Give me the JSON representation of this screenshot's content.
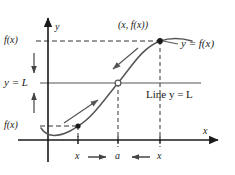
{
  "figure": {
    "type": "calculus-limit-diagram",
    "background_color": "#ffffff",
    "ink_color": "#1a1a1a",
    "curve_color": "#555555",
    "axes": {
      "y_axis_label": "y",
      "x_axis_label": "x",
      "origin_x": 48,
      "origin_y": 140
    },
    "labels": {
      "upper_value": "f(x)",
      "limit_value": "y = L",
      "lower_value": "f(x)",
      "point_label": "(x, f(x))",
      "curve_label": "y = f(x)",
      "line_label": "Line y = L",
      "axis_left_x": "x",
      "axis_center_a": "a",
      "axis_right_x": "x",
      "arrow_right": "⟶",
      "arrow_left": "⟵"
    },
    "guides": {
      "upper_dashed_y": 41,
      "limit_line_y": 83,
      "lower_dashed_y": 126,
      "left_x_vline": 78,
      "a_vline": 118,
      "right_x_vline": 160
    },
    "markers": [
      {
        "name": "lower-left-point",
        "style": "filled",
        "x": 78,
        "y": 126
      },
      {
        "name": "limit-point",
        "style": "hollow",
        "x": 118,
        "y": 83
      },
      {
        "name": "upper-right-point",
        "style": "filled",
        "x": 160,
        "y": 41
      }
    ],
    "motion_arrows": [
      {
        "name": "y-axis-down-arrow",
        "direction": "down"
      },
      {
        "name": "y-axis-up-arrow",
        "direction": "up"
      },
      {
        "name": "curve-arrow-lower",
        "direction": "up-right"
      },
      {
        "name": "curve-arrow-upper",
        "direction": "down-left"
      }
    ]
  }
}
